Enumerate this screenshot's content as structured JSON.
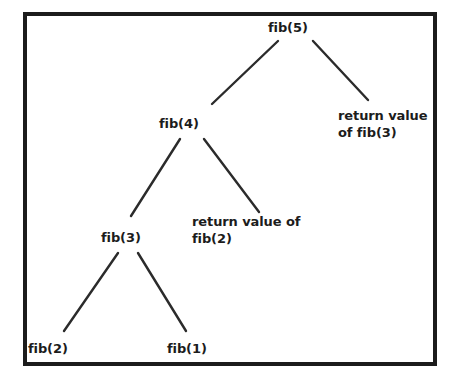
{
  "figure": {
    "type": "recursion-tree",
    "frame_color": "#1c1c1c",
    "text_color": "#1c1c1c",
    "background_color": "#ffffff",
    "edge_color": "#2b2b2b"
  },
  "nodes": [
    {
      "id": "fib5",
      "label": "fib(5)",
      "x": 268,
      "y": 19,
      "align": "left"
    },
    {
      "id": "fib4",
      "label": "fib(4)",
      "x": 159,
      "y": 115,
      "align": "left"
    },
    {
      "id": "ret_fib3",
      "label": "return value\nof fib(3)",
      "x": 338,
      "y": 107,
      "align": "left"
    },
    {
      "id": "fib3",
      "label": "fib(3)",
      "x": 101,
      "y": 229,
      "align": "left"
    },
    {
      "id": "ret_fib2",
      "label": "return value of\nfib(2)",
      "x": 192,
      "y": 213,
      "align": "left"
    },
    {
      "id": "fib2",
      "label": "fib(2)",
      "x": 28,
      "y": 340,
      "align": "left"
    },
    {
      "id": "fib1",
      "label": "fib(1)",
      "x": 167,
      "y": 340,
      "align": "left"
    }
  ],
  "edges": [
    {
      "id": "fib5-fib4",
      "from": "fib(5)",
      "to": "fib(4)",
      "x1": 278,
      "y1": 41,
      "x2": 212,
      "y2": 104
    },
    {
      "id": "fib5-retfib3",
      "from": "fib(5)",
      "to": "return value of fib(3)",
      "x1": 313,
      "y1": 41,
      "x2": 368,
      "y2": 100
    },
    {
      "id": "fib4-fib3",
      "from": "fib(4)",
      "to": "fib(3)",
      "x1": 180,
      "y1": 139,
      "x2": 131,
      "y2": 216
    },
    {
      "id": "fib4-retfib2",
      "from": "fib(4)",
      "to": "return value of fib(2)",
      "x1": 204,
      "y1": 139,
      "x2": 259,
      "y2": 212
    },
    {
      "id": "fib3-fib2",
      "from": "fib(3)",
      "to": "fib(2)",
      "x1": 118,
      "y1": 253,
      "x2": 64,
      "y2": 331
    },
    {
      "id": "fib3-fib1",
      "from": "fib(3)",
      "to": "fib(1)",
      "x1": 138,
      "y1": 253,
      "x2": 186,
      "y2": 331
    }
  ]
}
